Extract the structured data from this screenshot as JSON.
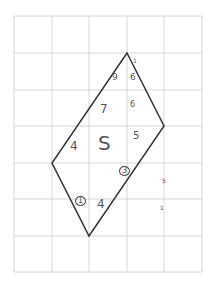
{
  "grid": {
    "x_lines": [
      14,
      52,
      89,
      127,
      164,
      202
    ],
    "y_lines": [
      16,
      53,
      90,
      126,
      163,
      199,
      236,
      272
    ],
    "color": "#d6d6d6"
  },
  "shape": {
    "type": "quadrilateral",
    "points": "127,53 164,126 89,236 52,163",
    "stroke": "#333333"
  },
  "labels": [
    {
      "text": "9",
      "x": 112,
      "y": 73,
      "size": 9
    },
    {
      "text": "6",
      "x": 130,
      "y": 73,
      "size": 9
    },
    {
      "text": "1",
      "x": 133,
      "y": 58,
      "size": 6
    },
    {
      "text": "7",
      "x": 100,
      "y": 103,
      "size": 12
    },
    {
      "text": "6",
      "x": 130,
      "y": 101,
      "size": 8
    },
    {
      "text": "4",
      "x": 70,
      "y": 140,
      "size": 12
    },
    {
      "text": "S",
      "x": 98,
      "y": 133,
      "size": 20
    },
    {
      "text": "5",
      "x": 133,
      "y": 131,
      "size": 10
    },
    {
      "text": "3",
      "x": 119,
      "y": 166,
      "size": 8,
      "circled": true
    },
    {
      "text": "1",
      "x": 75,
      "y": 196,
      "size": 8,
      "circled": true
    },
    {
      "text": "4",
      "x": 97,
      "y": 198,
      "size": 12
    },
    {
      "text": "5",
      "x": 162,
      "y": 178,
      "size": 6
    },
    {
      "text": "1",
      "x": 160,
      "y": 205,
      "size": 6
    }
  ]
}
